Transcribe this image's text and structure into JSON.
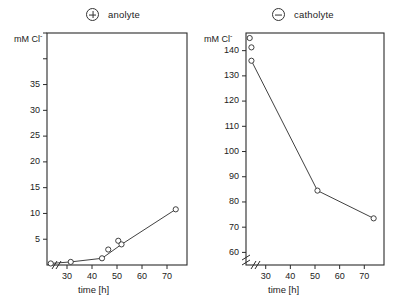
{
  "figure": {
    "panels": [
      {
        "id": "anolyte",
        "legend_label": "anolyte",
        "legend_symbol": "circled-plus",
        "ylabel": "mM Cl",
        "ylabel_sup": "-",
        "xlabel": "time [h]"
      },
      {
        "id": "catholyte",
        "legend_label": "catholyte",
        "legend_symbol": "circled-minus",
        "ylabel": "mM Cl",
        "ylabel_sup": "-",
        "xlabel": "time [h]"
      }
    ]
  },
  "chart_data": [
    {
      "type": "line",
      "id": "anolyte-chart",
      "title": "anolyte",
      "legend_symbol": "⊕",
      "legend_position": "top-center",
      "xlabel": "time [h]",
      "ylabel": "mM Cl-",
      "xlim": [
        22,
        78
      ],
      "ylim": [
        0,
        45
      ],
      "xticks": [
        30,
        40,
        50,
        60,
        70
      ],
      "xtick_labels": [
        "30",
        "40",
        "50",
        "60",
        "70"
      ],
      "yticks": [
        5,
        10,
        15,
        20,
        25,
        30,
        35,
        40,
        45
      ],
      "ytick_labels": [
        "5",
        "10",
        "15",
        "20",
        "25",
        "30",
        "35",
        "",
        ""
      ],
      "axis_break_x": true,
      "axis_break_y": false,
      "grid": false,
      "marker": "open-circle",
      "x": [
        23.5,
        31.5,
        44.0,
        46.5,
        50.5,
        51.8,
        73.5
      ],
      "y": [
        0.3,
        0.6,
        1.3,
        3.0,
        4.7,
        4.0,
        10.8
      ],
      "line_through_points": [
        0,
        1,
        2,
        5,
        6
      ]
    },
    {
      "type": "line",
      "id": "catholyte-chart",
      "title": "catholyte",
      "legend_symbol": "⊖",
      "legend_position": "top-center",
      "xlabel": "time [h]",
      "ylabel": "mM Cl-",
      "xlim": [
        22,
        78
      ],
      "ylim": [
        55,
        147
      ],
      "xticks": [
        30,
        40,
        50,
        60,
        70
      ],
      "xtick_labels": [
        "30",
        "40",
        "50",
        "60",
        "70"
      ],
      "yticks": [
        60,
        70,
        80,
        90,
        100,
        110,
        120,
        130,
        140
      ],
      "ytick_labels": [
        "60",
        "70",
        "80",
        "90",
        "100",
        "110",
        "120",
        "130",
        "140"
      ],
      "axis_break_x": true,
      "axis_break_y": true,
      "grid": false,
      "marker": "open-circle",
      "x": [
        23.5,
        24.2,
        24.2,
        51.0,
        73.8
      ],
      "y": [
        145.0,
        141.3,
        136.0,
        84.5,
        73.5
      ],
      "line_through_points": [
        2,
        3,
        4
      ]
    }
  ]
}
